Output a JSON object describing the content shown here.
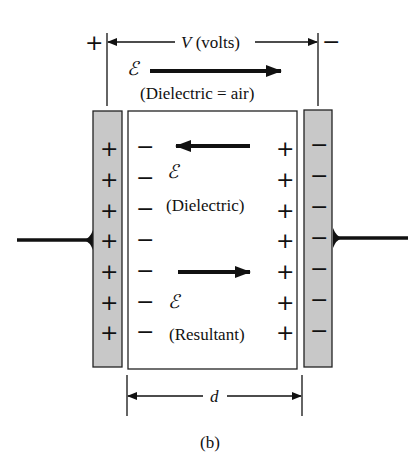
{
  "figure": {
    "caption": "(b)",
    "voltage_label_var": "V",
    "voltage_label_unit": " (volts)",
    "source_plus": "+",
    "source_minus": "−",
    "distance_label": "d",
    "field_symbol": "ℰ",
    "air_field": {
      "label": "(Dielectric  =  air)",
      "direction": "right"
    },
    "dielectric_field": {
      "label": "(Dielectric)",
      "direction": "left"
    },
    "resultant_field": {
      "label": "(Resultant)",
      "direction": "right"
    },
    "left_plate": {
      "charge": "+",
      "count": 7,
      "fill": "#c8c8c8"
    },
    "right_plate": {
      "charge": "−",
      "count": 7,
      "fill": "#c8c8c8"
    },
    "dielectric_surface_left_charge": "−",
    "dielectric_surface_right_charge": "+"
  },
  "colors": {
    "ink": "#111111",
    "plate_fill": "#c8c8c8",
    "background": "#ffffff"
  }
}
